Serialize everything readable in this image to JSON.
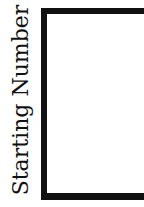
{
  "chart_data": {
    "type": "line",
    "title": "",
    "xlabel": "",
    "ylabel": "Starting Number",
    "series": [],
    "grid": false
  },
  "figure": {
    "ylabel": "Starting Number",
    "colors": {
      "frame": "#111111",
      "background": "#ffffff",
      "text": "#111111"
    }
  }
}
